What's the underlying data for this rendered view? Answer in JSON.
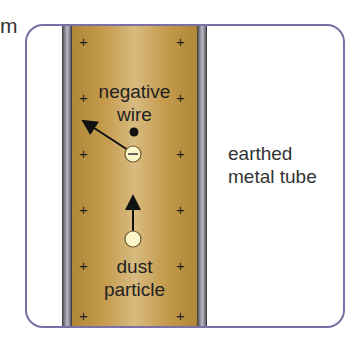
{
  "diagram": {
    "cut_text": "m",
    "tube_label": [
      "earthed",
      "metal tube"
    ],
    "wire_label": [
      "negative",
      "wire"
    ],
    "particle_label": [
      "dust",
      "particle"
    ],
    "ion_symbol": "−",
    "plus_symbol": "+",
    "colors": {
      "frame": "#7a6fa6",
      "gold": "#c49a4c",
      "particle_fill": "#fdf6c8",
      "wall": "#8d8a96"
    }
  }
}
